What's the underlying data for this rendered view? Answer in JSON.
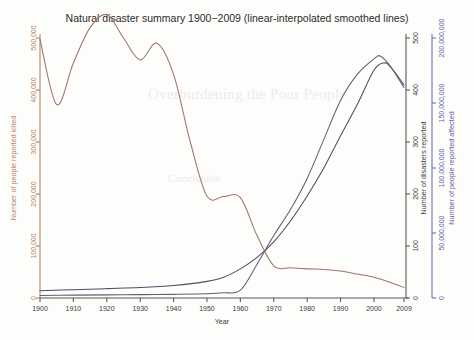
{
  "chart_data": {
    "type": "line",
    "title": "Natural disaster summary 1900−2009 (linear-interpolated smoothed lines)",
    "xlabel": "Year",
    "grid": false,
    "legend": false,
    "xlim": [
      1900,
      2009
    ],
    "xticks": [
      "1900",
      "1910",
      "1920",
      "1930",
      "1940",
      "1950",
      "1960",
      "1970",
      "1980",
      "1990",
      "2000",
      "2009"
    ],
    "xtick_values": [
      1900,
      1910,
      1920,
      1930,
      1940,
      1950,
      1960,
      1970,
      1980,
      1990,
      2000,
      2009
    ],
    "axes": [
      {
        "id": "killed",
        "side": "left",
        "label": "Number of people reported killed",
        "color": "#bb7d5d",
        "line_color": "#9d7566",
        "lim": [
          0,
          500000
        ],
        "ticks": [
          0,
          100000,
          200000,
          300000,
          400000,
          500000
        ],
        "ticklabels": [
          "0",
          "100,000",
          "200,000",
          "300,000",
          "400,000",
          "500,000"
        ]
      },
      {
        "id": "disasters",
        "side": "right-inner",
        "label": "Number of disasters reported",
        "color": "#3b3b3b",
        "line_color": "#4d4d66",
        "lim": [
          0,
          500
        ],
        "ticks": [
          0,
          100,
          200,
          300,
          400,
          500
        ],
        "ticklabels": [
          "0",
          "100",
          "200",
          "300",
          "400",
          "500"
        ]
      },
      {
        "id": "affected",
        "side": "right-outer",
        "label": "Number of people reported affected",
        "color": "#5a63a8",
        "line_color": "#5f6076",
        "lim": [
          0,
          200000000
        ],
        "ticks": [
          0,
          50000000,
          100000000,
          150000000,
          200000000
        ],
        "ticklabels": [
          "0",
          "50,000,000",
          "100,000,000",
          "150,000,000",
          "200,000,000"
        ]
      }
    ],
    "series": [
      {
        "name": "Number of people reported killed",
        "axis": "killed",
        "units": "people",
        "x": [
          1900,
          1905,
          1910,
          1915,
          1920,
          1925,
          1930,
          1935,
          1940,
          1945,
          1950,
          1955,
          1960,
          1965,
          1970,
          1975,
          1980,
          1985,
          1990,
          1995,
          2000,
          2005,
          2009
        ],
        "values": [
          498000,
          372000,
          452000,
          520000,
          545000,
          500000,
          458000,
          490000,
          430000,
          300000,
          196000,
          195000,
          193000,
          120000,
          62000,
          58000,
          56000,
          55000,
          52000,
          46000,
          40000,
          30000,
          20000
        ]
      },
      {
        "name": "Number of disasters reported",
        "axis": "disasters",
        "units": "events",
        "x": [
          1900,
          1910,
          1920,
          1930,
          1940,
          1950,
          1955,
          1960,
          1965,
          1970,
          1975,
          1980,
          1985,
          1990,
          1995,
          2000,
          2003,
          2005,
          2009
        ],
        "values": [
          14,
          16,
          18,
          20,
          24,
          32,
          40,
          56,
          78,
          108,
          148,
          196,
          250,
          312,
          372,
          438,
          452,
          444,
          410
        ]
      },
      {
        "name": "Number of people reported affected",
        "axis": "affected",
        "units": "people",
        "x": [
          1900,
          1910,
          1920,
          1930,
          1940,
          1950,
          1955,
          1960,
          1965,
          1970,
          1975,
          1980,
          1985,
          1990,
          1995,
          2000,
          2002,
          2005,
          2009
        ],
        "values": [
          2000000,
          2200000,
          2400000,
          2600000,
          2800000,
          3200000,
          4000000,
          6000000,
          26000000,
          48000000,
          68000000,
          92000000,
          122000000,
          152000000,
          172000000,
          184000000,
          186000000,
          178000000,
          162000000
        ]
      }
    ]
  },
  "ghost_text": {
    "line1": "Overburdening the Poor People",
    "line2": "Conclusion"
  }
}
